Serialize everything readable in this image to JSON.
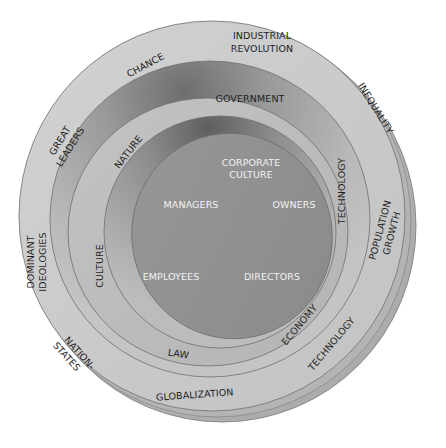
{
  "diagram": {
    "type": "concentric-layers",
    "colors": {
      "background": "#ffffff",
      "outer_ring": "#c9c9c9",
      "outer_edge": "#a9a9a9",
      "band_two": "#b7b7b7",
      "middle_ring": "#bfbfbf",
      "inner_band": "#9c9c9c",
      "core": "#8f8f8f",
      "stroke": "#6f6f6f",
      "dark_text": "#1e1e1e",
      "light_text": "#f2f2f2"
    },
    "core": {
      "title_line1": "CORPORATE",
      "title_line2": "CULTURE",
      "actors": [
        "MANAGERS",
        "OWNERS",
        "EMPLOYEES",
        "DIRECTORS"
      ]
    },
    "middle_ring": {
      "labels": [
        "GOVERNMENT",
        "NATURE",
        "TECHNOLOGY",
        "CULTURE",
        "ECONOMY",
        "LAW"
      ]
    },
    "outer_ring": {
      "labels": [
        {
          "line1": "INDUSTRIAL",
          "line2": "REVOLUTION"
        },
        {
          "line1": "CHANCE",
          "line2": ""
        },
        {
          "line1": "INEQUALITY",
          "line2": ""
        },
        {
          "line1": "GREAT",
          "line2": "LEADERS"
        },
        {
          "line1": "POPULATION",
          "line2": "GROWTH"
        },
        {
          "line1": "DOMINANT",
          "line2": "IDEOLOGIES"
        },
        {
          "line1": "TECHNOLOGY",
          "line2": ""
        },
        {
          "line1": "NATION-",
          "line2": "STATES"
        },
        {
          "line1": "GLOBALIZATION",
          "line2": ""
        }
      ]
    }
  }
}
